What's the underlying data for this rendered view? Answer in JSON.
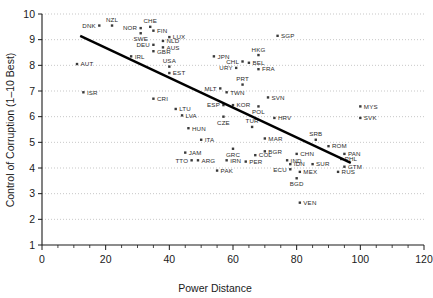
{
  "chart_data": {
    "type": "scatter",
    "title": "",
    "xlabel": "Power Distance",
    "ylabel": "Control of Corruption (1–10 Best)",
    "xlim": [
      0,
      120
    ],
    "ylim": [
      1,
      10
    ],
    "xticks": [
      0,
      20,
      40,
      60,
      80,
      100,
      120
    ],
    "xticklabels": [
      "0",
      "20",
      "40",
      "60",
      "80",
      "100",
      "120"
    ],
    "xminor_step": 5,
    "yticks": [
      1,
      2,
      3,
      4,
      5,
      6,
      7,
      8,
      9,
      10
    ],
    "yticklabels": [
      "1",
      "2",
      "3",
      "4",
      "5",
      "6",
      "7",
      "8",
      "9",
      "10"
    ],
    "grid": "horizontal-dotted",
    "legend": "none",
    "marker_color": "#3a3a3a",
    "trendline_color": "#000000",
    "trendline": {
      "x0": 12,
      "y0": 9.15,
      "x1": 97,
      "y1": 4.2
    },
    "points": [
      {
        "label": "DNK",
        "x": 18,
        "y": 9.55,
        "lp": "left"
      },
      {
        "label": "NZL",
        "x": 22,
        "y": 9.55,
        "lp": "above"
      },
      {
        "label": "NOR",
        "x": 31,
        "y": 9.45,
        "lp": "left"
      },
      {
        "label": "CHE",
        "x": 34,
        "y": 9.5,
        "lp": "above"
      },
      {
        "label": "FIN",
        "x": 35,
        "y": 9.35,
        "lp": "right"
      },
      {
        "label": "SWE",
        "x": 31,
        "y": 9.25,
        "lp": "below"
      },
      {
        "label": "LUX",
        "x": 40,
        "y": 9.1,
        "lp": "right"
      },
      {
        "label": "NLD",
        "x": 38,
        "y": 8.95,
        "lp": "right"
      },
      {
        "label": "DEU",
        "x": 35,
        "y": 8.8,
        "lp": "left"
      },
      {
        "label": "AUS",
        "x": 38,
        "y": 8.7,
        "lp": "right"
      },
      {
        "label": "GBR",
        "x": 35,
        "y": 8.55,
        "lp": "right"
      },
      {
        "label": "IRL",
        "x": 28,
        "y": 8.35,
        "lp": "right"
      },
      {
        "label": "AUT",
        "x": 11,
        "y": 8.05,
        "lp": "right"
      },
      {
        "label": "USA",
        "x": 40,
        "y": 7.95,
        "lp": "above"
      },
      {
        "label": "EST",
        "x": 40,
        "y": 7.7,
        "lp": "right"
      },
      {
        "label": "JPN",
        "x": 54,
        "y": 8.35,
        "lp": "right"
      },
      {
        "label": "HKG",
        "x": 68,
        "y": 8.4,
        "lp": "above"
      },
      {
        "label": "SGP",
        "x": 74,
        "y": 9.15,
        "lp": "right"
      },
      {
        "label": "CHL",
        "x": 63,
        "y": 8.15,
        "lp": "left"
      },
      {
        "label": "BEL",
        "x": 65,
        "y": 8.1,
        "lp": "right"
      },
      {
        "label": "URY",
        "x": 61,
        "y": 7.9,
        "lp": "left"
      },
      {
        "label": "FRA",
        "x": 68,
        "y": 7.85,
        "lp": "right"
      },
      {
        "label": "ISR",
        "x": 13,
        "y": 6.95,
        "lp": "right"
      },
      {
        "label": "CRI",
        "x": 35,
        "y": 6.7,
        "lp": "right"
      },
      {
        "label": "MLT",
        "x": 56,
        "y": 7.1,
        "lp": "left"
      },
      {
        "label": "PRT",
        "x": 63,
        "y": 7.25,
        "lp": "above"
      },
      {
        "label": "TWN",
        "x": 58,
        "y": 6.95,
        "lp": "right"
      },
      {
        "label": "SVN",
        "x": 71,
        "y": 6.75,
        "lp": "right"
      },
      {
        "label": "LTU",
        "x": 42,
        "y": 6.3,
        "lp": "right"
      },
      {
        "label": "ESP",
        "x": 57,
        "y": 6.45,
        "lp": "left"
      },
      {
        "label": "KOR",
        "x": 60,
        "y": 6.45,
        "lp": "right"
      },
      {
        "label": "POL",
        "x": 68,
        "y": 6.4,
        "lp": "below"
      },
      {
        "label": "MYS",
        "x": 100,
        "y": 6.4,
        "lp": "right"
      },
      {
        "label": "LVA",
        "x": 44,
        "y": 6.05,
        "lp": "right"
      },
      {
        "label": "CZE",
        "x": 57,
        "y": 6.0,
        "lp": "below"
      },
      {
        "label": "HRV",
        "x": 73,
        "y": 5.95,
        "lp": "right"
      },
      {
        "label": "SVK",
        "x": 100,
        "y": 5.95,
        "lp": "right"
      },
      {
        "label": "HUN",
        "x": 46,
        "y": 5.55,
        "lp": "right"
      },
      {
        "label": "TUR",
        "x": 66,
        "y": 5.6,
        "lp": "above"
      },
      {
        "label": "ITA",
        "x": 50,
        "y": 5.1,
        "lp": "right"
      },
      {
        "label": "MAR",
        "x": 70,
        "y": 5.15,
        "lp": "right"
      },
      {
        "label": "SRB",
        "x": 86,
        "y": 5.1,
        "lp": "above"
      },
      {
        "label": "ROM",
        "x": 90,
        "y": 4.85,
        "lp": "right"
      },
      {
        "label": "JAM",
        "x": 45,
        "y": 4.6,
        "lp": "right"
      },
      {
        "label": "GRC",
        "x": 60,
        "y": 4.75,
        "lp": "below"
      },
      {
        "label": "BGR",
        "x": 70,
        "y": 4.65,
        "lp": "right"
      },
      {
        "label": "COL",
        "x": 67,
        "y": 4.5,
        "lp": "right"
      },
      {
        "label": "CHN",
        "x": 80,
        "y": 4.55,
        "lp": "right"
      },
      {
        "label": "PAN",
        "x": 95,
        "y": 4.55,
        "lp": "right"
      },
      {
        "label": "PHL",
        "x": 94,
        "y": 4.35,
        "lp": "right"
      },
      {
        "label": "TTO",
        "x": 47,
        "y": 4.3,
        "lp": "left"
      },
      {
        "label": "ARG",
        "x": 49,
        "y": 4.3,
        "lp": "right"
      },
      {
        "label": "IRN",
        "x": 58,
        "y": 4.3,
        "lp": "right"
      },
      {
        "label": "PER",
        "x": 64,
        "y": 4.25,
        "lp": "right"
      },
      {
        "label": "IND",
        "x": 77,
        "y": 4.3,
        "lp": "right"
      },
      {
        "label": "IDN",
        "x": 78,
        "y": 4.15,
        "lp": "right"
      },
      {
        "label": "SUR",
        "x": 85,
        "y": 4.15,
        "lp": "right"
      },
      {
        "label": "GTM",
        "x": 95,
        "y": 4.05,
        "lp": "right"
      },
      {
        "label": "PAK",
        "x": 55,
        "y": 3.9,
        "lp": "right"
      },
      {
        "label": "ECU",
        "x": 78,
        "y": 3.95,
        "lp": "left"
      },
      {
        "label": "MEX",
        "x": 81,
        "y": 3.85,
        "lp": "right"
      },
      {
        "label": "RUS",
        "x": 93,
        "y": 3.85,
        "lp": "right"
      },
      {
        "label": "BGD",
        "x": 80,
        "y": 3.6,
        "lp": "below"
      },
      {
        "label": "VEN",
        "x": 81,
        "y": 2.65,
        "lp": "right"
      }
    ]
  }
}
